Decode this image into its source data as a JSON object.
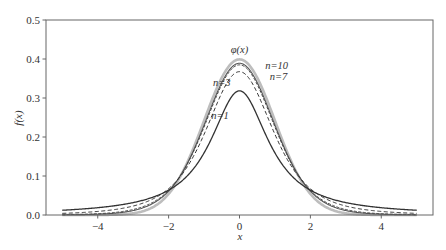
{
  "chart_data": {
    "type": "line",
    "title": "",
    "xlabel": "x",
    "ylabel": "f(x)",
    "xlim": [
      -5.46,
      5.46
    ],
    "ylim": [
      0.0,
      0.5
    ],
    "xticks": [
      -4,
      -2,
      0,
      2,
      4
    ],
    "xtick_labels": [
      "−4",
      "−2",
      "0",
      "2",
      "4"
    ],
    "yticks": [
      0.0,
      0.1,
      0.2,
      0.3,
      0.4,
      0.5
    ],
    "ytick_labels": [
      "0.0",
      "0.1",
      "0.2",
      "0.3",
      "0.4",
      "0.5"
    ],
    "grid": false,
    "legend": "none (inline annotations)",
    "x_range_plotted": [
      -5,
      5
    ],
    "series": [
      {
        "name": "φ(x)",
        "kind": "normal",
        "peak": 0.3989,
        "color": "#bdbdbd",
        "width": 2.6,
        "dash": ""
      },
      {
        "name": "n=10",
        "kind": "t",
        "df": 10,
        "peak": 0.3891,
        "color": "#555555",
        "width": 1.1,
        "dash": ""
      },
      {
        "name": "n=7",
        "kind": "t",
        "df": 7,
        "peak": 0.3796,
        "color": "#444444",
        "width": 1.0,
        "dash": "3,1.5"
      },
      {
        "name": "n=3",
        "kind": "t",
        "df": 3,
        "peak": 0.3676,
        "color": "#333333",
        "width": 1.0,
        "dash": "4,2.5"
      },
      {
        "name": "n=1",
        "kind": "t",
        "df": 1,
        "peak": 0.3183,
        "color": "#333333",
        "width": 1.3,
        "dash": ""
      }
    ],
    "annotations": [
      {
        "text": "φ(x)",
        "x": 0.0,
        "y": 0.415
      },
      {
        "text": "n=10",
        "x": 1.05,
        "y": 0.375
      },
      {
        "text": "n=7",
        "x": 1.1,
        "y": 0.347
      },
      {
        "text": "n=3",
        "x": -0.5,
        "y": 0.33
      },
      {
        "text": "n=1",
        "x": -0.55,
        "y": 0.245
      }
    ]
  }
}
